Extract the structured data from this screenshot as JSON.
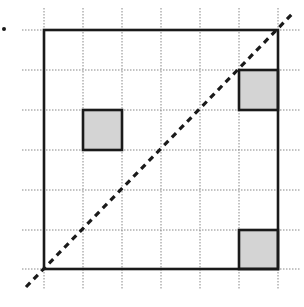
{
  "diagram": {
    "type": "grid-with-shaded-cells",
    "grid": {
      "columns": 6,
      "rows": 6,
      "x_lines": [
        44,
        83,
        122,
        161,
        200,
        239,
        278
      ],
      "y_lines": [
        30,
        70,
        110,
        150,
        190,
        230,
        269
      ],
      "extend_x": [
        22,
        300
      ],
      "extend_y": [
        8,
        290
      ],
      "line_color": "#888888",
      "line_style": "dotted"
    },
    "outer_square": {
      "x": 44,
      "y": 30,
      "width": 234,
      "height": 239,
      "stroke": "#1a1a1a"
    },
    "shaded_cells": [
      {
        "col": 1,
        "row": 2,
        "label": "shaded-square-left"
      },
      {
        "col": 5,
        "row": 1,
        "label": "shaded-square-top-right"
      },
      {
        "col": 5,
        "row": 5,
        "label": "shaded-square-bottom-right"
      }
    ],
    "shade_color": "#d4d4d4",
    "diagonal": {
      "x1": 26,
      "y1": 287,
      "x2": 293,
      "y2": 13,
      "style": "dashed",
      "color": "#1a1a1a"
    },
    "marker_dot": {
      "x": 4,
      "y": 29,
      "color": "#1a1a1a"
    }
  }
}
